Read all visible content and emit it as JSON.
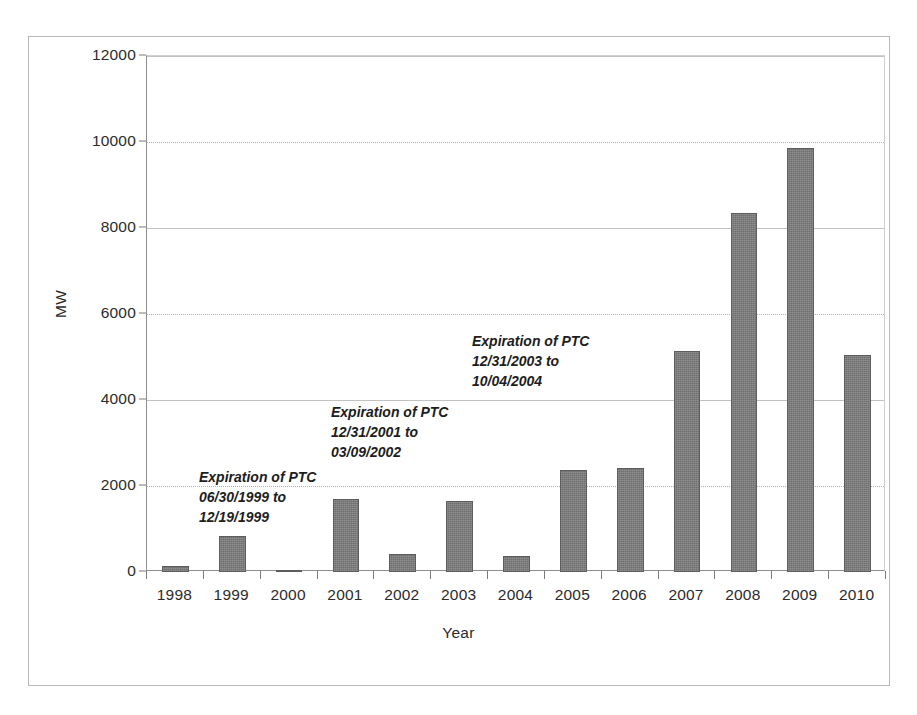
{
  "figure": {
    "y_axis_title": "MW",
    "x_axis_title": "Year"
  },
  "annotations": [
    {
      "id": "ptc-1999",
      "line1": "Expiration of PTC",
      "line2": "06/30/1999 to",
      "line3": "12/19/1999"
    },
    {
      "id": "ptc-2002",
      "line1": "Expiration of PTC",
      "line2": "12/31/2001 to",
      "line3": "03/09/2002"
    },
    {
      "id": "ptc-2004",
      "line1": "Expiration of PTC",
      "line2": "12/31/2003 to",
      "line3": "10/04/2004"
    }
  ],
  "chart_data": {
    "type": "bar",
    "title": "",
    "xlabel": "Year",
    "ylabel": "MW",
    "categories": [
      "1998",
      "1999",
      "2000",
      "2001",
      "2002",
      "2003",
      "2004",
      "2005",
      "2006",
      "2007",
      "2008",
      "2009",
      "2010"
    ],
    "values": [
      140,
      840,
      50,
      1700,
      410,
      1660,
      370,
      2380,
      2430,
      5150,
      8350,
      9850,
      5050
    ],
    "ylim": [
      0,
      12000
    ],
    "yticks": [
      0,
      2000,
      4000,
      6000,
      8000,
      10000,
      12000
    ],
    "ytick_labels": [
      "0",
      "2000",
      "4000",
      "6000",
      "8000",
      "10000",
      "12000"
    ],
    "grid": true,
    "legend": false,
    "bar_color": "#6e6e6e",
    "annotations": [
      "Expiration of PTC 06/30/1999 to 12/19/1999",
      "Expiration of PTC 12/31/2001 to 03/09/2002",
      "Expiration of PTC 12/31/2003 to 10/04/2004"
    ]
  }
}
